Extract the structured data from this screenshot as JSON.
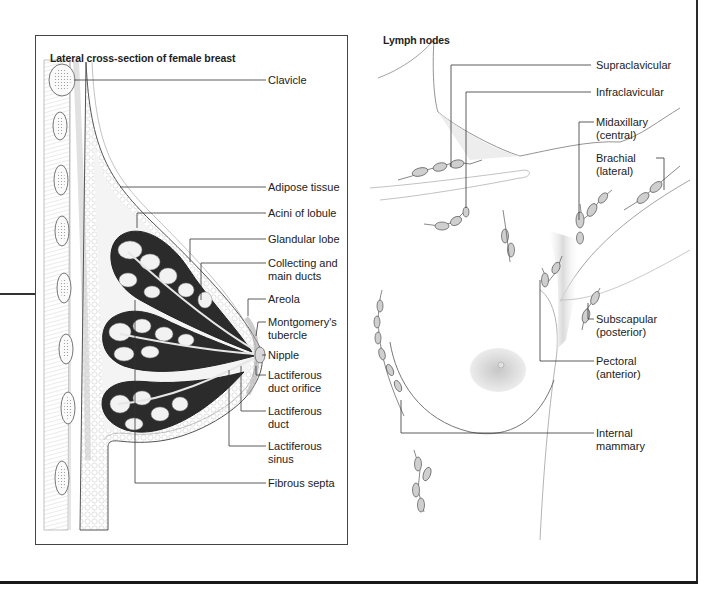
{
  "left_panel": {
    "title": "Lateral cross-section of female breast",
    "labels": [
      {
        "id": "clavicle",
        "lines": [
          "Clavicle"
        ]
      },
      {
        "id": "adipose-tissue",
        "lines": [
          "Adipose tissue"
        ]
      },
      {
        "id": "acini-of-lobule",
        "lines": [
          "Acini of lobule"
        ]
      },
      {
        "id": "glandular-lobe",
        "lines": [
          "Glandular lobe"
        ]
      },
      {
        "id": "collecting-and-main-ducts",
        "lines": [
          "Collecting and",
          "main ducts"
        ]
      },
      {
        "id": "areola",
        "lines": [
          "Areola"
        ]
      },
      {
        "id": "montgomerys-tubercle",
        "lines": [
          "Montgomery's",
          "tubercle"
        ]
      },
      {
        "id": "nipple",
        "lines": [
          "Nipple"
        ]
      },
      {
        "id": "lactiferous-duct-orifice",
        "lines": [
          "Lactiferous",
          "duct orifice"
        ]
      },
      {
        "id": "lactiferous-duct",
        "lines": [
          "Lactiferous",
          "duct"
        ]
      },
      {
        "id": "lactiferous-sinus",
        "lines": [
          "Lactiferous",
          "sinus"
        ]
      },
      {
        "id": "fibrous-septa",
        "lines": [
          "Fibrous septa"
        ]
      }
    ]
  },
  "right_panel": {
    "title": "Lymph nodes",
    "labels": [
      {
        "id": "supraclavicular",
        "lines": [
          "Supraclavicular"
        ]
      },
      {
        "id": "infraclavicular",
        "lines": [
          "Infraclavicular"
        ]
      },
      {
        "id": "midaxillary",
        "lines": [
          "Midaxillary",
          "(central)"
        ]
      },
      {
        "id": "brachial",
        "lines": [
          "Brachial",
          "(lateral)"
        ]
      },
      {
        "id": "subscapular",
        "lines": [
          "Subscapular",
          "(posterior)"
        ]
      },
      {
        "id": "pectoral",
        "lines": [
          "Pectoral",
          "(anterior)"
        ]
      },
      {
        "id": "internal-mammary",
        "lines": [
          "Internal",
          "mammary"
        ]
      }
    ]
  },
  "colors": {
    "line": "#333333",
    "tissue_dark": "#2b2b2b",
    "tissue_shade": "#bdbdbd",
    "areola": "#b8b8b8",
    "background": "#ffffff"
  }
}
